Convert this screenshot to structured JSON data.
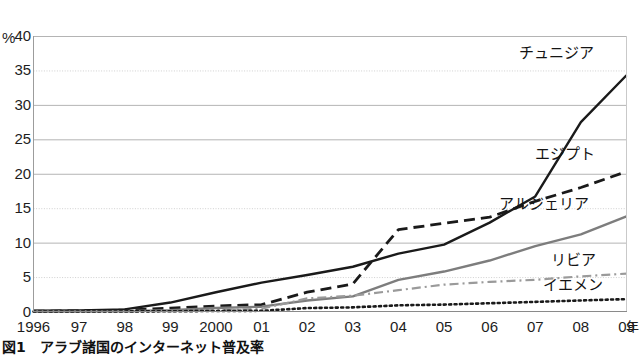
{
  "chart_data": {
    "type": "line",
    "title": "図1　アラブ諸国のインターネット普及率",
    "xlabel": "年",
    "ylabel": "%",
    "ylim": [
      0,
      40
    ],
    "yticks": [
      0,
      5,
      10,
      15,
      20,
      25,
      30,
      35,
      40
    ],
    "ytick_labels": [
      "0",
      "5",
      "10",
      "15",
      "20",
      "25",
      "30",
      "35",
      "40"
    ],
    "grid": true,
    "legend_position": "inline-right-annotations",
    "x": [
      1996,
      1997,
      1998,
      1999,
      2000,
      2001,
      2002,
      2003,
      2004,
      2005,
      2006,
      2007,
      2008,
      2009
    ],
    "xtick_labels": [
      "1996",
      "97",
      "98",
      "99",
      "2000",
      "01",
      "02",
      "03",
      "04",
      "05",
      "06",
      "07",
      "08",
      "09"
    ],
    "series": [
      {
        "name": "チュニジア",
        "style": "solid",
        "color": "#1a1a1a",
        "values": [
          0.1,
          0.15,
          0.3,
          1.3,
          2.8,
          4.2,
          5.3,
          6.5,
          8.4,
          9.7,
          12.9,
          16.7,
          27.5,
          34.3
        ]
      },
      {
        "name": "エジプト",
        "style": "dashed",
        "color": "#1a1a1a",
        "values": [
          0.05,
          0.1,
          0.2,
          0.5,
          0.8,
          1.0,
          2.8,
          4.0,
          11.9,
          12.8,
          13.7,
          16.0,
          18.0,
          20.3
        ]
      },
      {
        "name": "アルジェリア",
        "style": "solid",
        "color": "#7d7d7d",
        "values": [
          0.0,
          0.02,
          0.05,
          0.2,
          0.5,
          0.7,
          1.6,
          2.2,
          4.6,
          5.8,
          7.4,
          9.5,
          11.2,
          13.8
        ]
      },
      {
        "name": "リビア",
        "style": "dash-dot",
        "color": "#9a9a9a",
        "values": [
          0.0,
          0.0,
          0.02,
          0.05,
          0.2,
          0.4,
          1.9,
          2.3,
          3.1,
          3.9,
          4.3,
          4.6,
          5.1,
          5.5
        ]
      },
      {
        "name": "イエメン",
        "style": "dotted",
        "color": "#1a1a1a",
        "values": [
          0.0,
          0.0,
          0.01,
          0.03,
          0.08,
          0.1,
          0.5,
          0.6,
          0.9,
          1.0,
          1.2,
          1.4,
          1.6,
          1.8
        ]
      }
    ]
  },
  "axis": {
    "y_unit": "%",
    "x_unit": "年"
  },
  "caption": {
    "text": "図1　アラブ諸国のインターネット普及率"
  }
}
